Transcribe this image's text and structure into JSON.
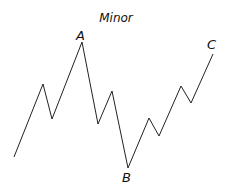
{
  "diagram": {
    "title": "Minor",
    "wave_points": [
      [
        14,
        157
      ],
      [
        43,
        84
      ],
      [
        52,
        119
      ],
      [
        82,
        42
      ],
      [
        98,
        124
      ],
      [
        112,
        91
      ],
      [
        128,
        168
      ],
      [
        149,
        118
      ],
      [
        159,
        136
      ],
      [
        181,
        86
      ],
      [
        191,
        103
      ],
      [
        213,
        54
      ]
    ],
    "labels": [
      {
        "text": "A",
        "x": 76,
        "y": 28
      },
      {
        "text": "B",
        "x": 122,
        "y": 170
      },
      {
        "text": "C",
        "x": 207,
        "y": 37
      }
    ],
    "line_color": "#222222"
  }
}
